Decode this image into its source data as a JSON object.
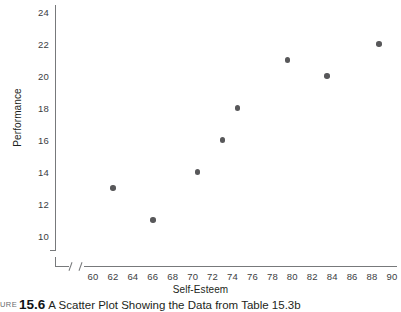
{
  "figure": {
    "caption_prefix": "URE",
    "caption_number": "15.6",
    "caption_text": "A Scatter Plot Showing the Data from Table 15.3b"
  },
  "chart_data": {
    "type": "scatter",
    "title": "",
    "xlabel": "Self-Esteem",
    "ylabel": "Performance",
    "xlim": [
      58,
      91
    ],
    "ylim": [
      9,
      25
    ],
    "grid": false,
    "legend": "none",
    "axis_break_x": true,
    "axis_break_y": true,
    "x_ticks": [
      60,
      62,
      64,
      66,
      68,
      70,
      72,
      74,
      76,
      78,
      80,
      82,
      84,
      86,
      88,
      90
    ],
    "y_ticks": [
      10,
      12,
      14,
      16,
      18,
      20,
      22,
      24
    ],
    "point_color": "#58585a",
    "axis_color": "#77797b",
    "points": [
      {
        "x": 62,
        "y": 13
      },
      {
        "x": 66,
        "y": 11
      },
      {
        "x": 70.5,
        "y": 14
      },
      {
        "x": 73,
        "y": 16
      },
      {
        "x": 74.5,
        "y": 18
      },
      {
        "x": 79.5,
        "y": 21
      },
      {
        "x": 83.5,
        "y": 20
      },
      {
        "x": 88.7,
        "y": 22
      }
    ]
  }
}
